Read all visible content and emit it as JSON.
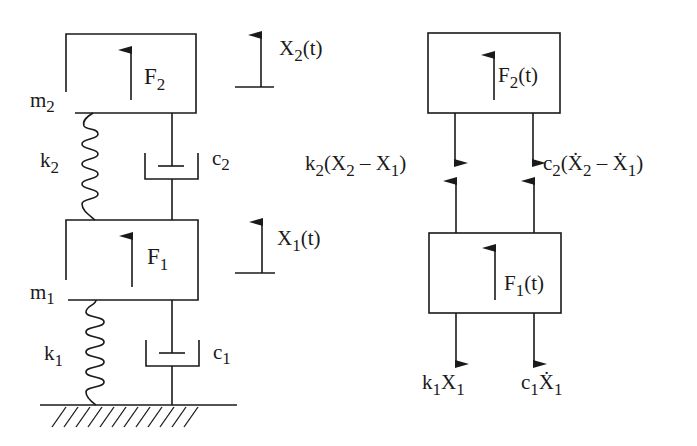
{
  "diagram": {
    "stroke_color": "#1a1a1a",
    "background": "#ffffff",
    "system": {
      "upper_mass": {
        "label": "m",
        "sub": "2",
        "force_label": "F",
        "force_sub": "2"
      },
      "lower_mass": {
        "label": "m",
        "sub": "1",
        "force_label": "F",
        "force_sub": "1"
      },
      "upper_spring": {
        "label": "k",
        "sub": "2"
      },
      "upper_damper": {
        "label": "c",
        "sub": "2"
      },
      "lower_spring": {
        "label": "k",
        "sub": "1"
      },
      "lower_damper": {
        "label": "c",
        "sub": "1"
      },
      "displacement_2": {
        "label": "X",
        "sub": "2",
        "tail": "(t)"
      },
      "displacement_1": {
        "label": "X",
        "sub": "1",
        "tail": "(t)"
      }
    },
    "free_body": {
      "upper_force": {
        "label": "F",
        "sub": "2",
        "tail": "(t)"
      },
      "lower_force": {
        "label": "F",
        "sub": "1",
        "tail": "(t)"
      },
      "spring_force_mid": {
        "k": "k",
        "ksub": "2",
        "open": "(X",
        "s1": "2",
        "minus": " – X",
        "s2": "1",
        "close": ")"
      },
      "damper_force_mid": {
        "c": "c",
        "csub": "2",
        "open": "(Ẋ",
        "s1": "2",
        "minus": " – Ẋ",
        "s2": "1",
        "close": ")"
      },
      "spring_force_bottom": {
        "k": "k",
        "ksub": "1",
        "x": "X",
        "xsub": "1"
      },
      "damper_force_bottom": {
        "c": "c",
        "csub": "1",
        "x": "Ẋ",
        "xsub": "1"
      }
    }
  }
}
